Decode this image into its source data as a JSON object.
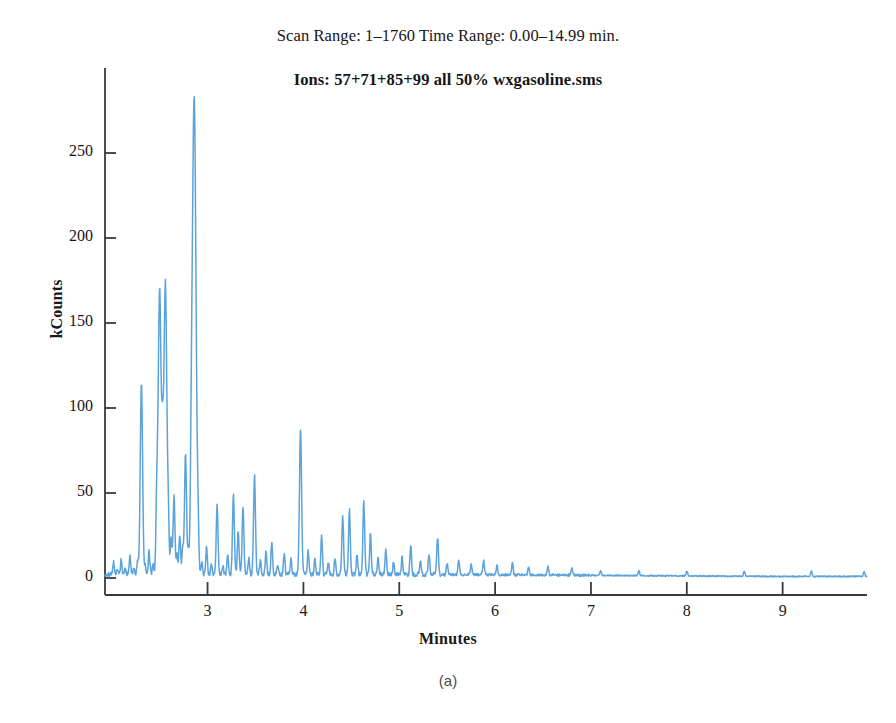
{
  "figure": {
    "panel_caption": "(a)",
    "header_line_1": "Scan Range: 1–1760 Time Range: 0.00–14.99 min.",
    "header_line_2": "Ions: 57+71+85+99 all 50% wxgasoline.sms",
    "trace_color": "#5BA3DC",
    "axis_color": "#3a3a3a"
  },
  "chart_data": {
    "type": "line",
    "title": "Ions: 57+71+85+99 all 50% wxgasoline.sms",
    "subtitle": "Scan Range: 1–1760 Time Range: 0.00–14.99 min.",
    "xlabel": "Minutes",
    "ylabel": "kCounts",
    "xlim": [
      1.93,
      9.88
    ],
    "ylim": [
      -6,
      300
    ],
    "xticks": [
      3,
      4,
      5,
      6,
      7,
      8,
      9
    ],
    "xtick_labels": [
      "3",
      "4",
      "5",
      "6",
      "7",
      "8",
      "9"
    ],
    "yticks": [
      0,
      50,
      100,
      150,
      200,
      250
    ],
    "ytick_labels": [
      "0",
      "50",
      "100",
      "150",
      "200",
      "250"
    ],
    "grid": false,
    "legend": null,
    "series": [
      {
        "name": "Ions 57+71+85+99 extracted ion chromatogram",
        "color": "#5BA3DC",
        "peaks": [
          {
            "x": 2.02,
            "y": 7
          },
          {
            "x": 2.06,
            "y": 3
          },
          {
            "x": 2.1,
            "y": 9
          },
          {
            "x": 2.14,
            "y": 4
          },
          {
            "x": 2.19,
            "y": 11
          },
          {
            "x": 2.23,
            "y": 4
          },
          {
            "x": 2.27,
            "y": 8
          },
          {
            "x": 2.31,
            "y": 113
          },
          {
            "x": 2.35,
            "y": 5
          },
          {
            "x": 2.39,
            "y": 14
          },
          {
            "x": 2.43,
            "y": 6
          },
          {
            "x": 2.47,
            "y": 40
          },
          {
            "x": 2.5,
            "y": 168
          },
          {
            "x": 2.53,
            "y": 60
          },
          {
            "x": 2.56,
            "y": 172
          },
          {
            "x": 2.59,
            "y": 30
          },
          {
            "x": 2.62,
            "y": 22
          },
          {
            "x": 2.65,
            "y": 46
          },
          {
            "x": 2.68,
            "y": 12
          },
          {
            "x": 2.71,
            "y": 24
          },
          {
            "x": 2.74,
            "y": 15
          },
          {
            "x": 2.77,
            "y": 72
          },
          {
            "x": 2.8,
            "y": 12
          },
          {
            "x": 2.83,
            "y": 35
          },
          {
            "x": 2.86,
            "y": 282
          },
          {
            "x": 2.9,
            "y": 18
          },
          {
            "x": 2.94,
            "y": 7
          },
          {
            "x": 2.99,
            "y": 16
          },
          {
            "x": 3.04,
            "y": 6
          },
          {
            "x": 3.1,
            "y": 41
          },
          {
            "x": 3.16,
            "y": 5
          },
          {
            "x": 3.21,
            "y": 12
          },
          {
            "x": 3.27,
            "y": 48
          },
          {
            "x": 3.32,
            "y": 26
          },
          {
            "x": 3.37,
            "y": 40
          },
          {
            "x": 3.43,
            "y": 10
          },
          {
            "x": 3.49,
            "y": 58
          },
          {
            "x": 3.55,
            "y": 8
          },
          {
            "x": 3.61,
            "y": 13
          },
          {
            "x": 3.67,
            "y": 18
          },
          {
            "x": 3.73,
            "y": 6
          },
          {
            "x": 3.8,
            "y": 12
          },
          {
            "x": 3.87,
            "y": 9
          },
          {
            "x": 3.97,
            "y": 85
          },
          {
            "x": 4.05,
            "y": 14
          },
          {
            "x": 4.12,
            "y": 9
          },
          {
            "x": 4.19,
            "y": 22
          },
          {
            "x": 4.26,
            "y": 7
          },
          {
            "x": 4.33,
            "y": 10
          },
          {
            "x": 4.41,
            "y": 35
          },
          {
            "x": 4.48,
            "y": 38
          },
          {
            "x": 4.56,
            "y": 12
          },
          {
            "x": 4.63,
            "y": 42
          },
          {
            "x": 4.7,
            "y": 24
          },
          {
            "x": 4.78,
            "y": 9
          },
          {
            "x": 4.86,
            "y": 14
          },
          {
            "x": 4.94,
            "y": 7
          },
          {
            "x": 5.03,
            "y": 10
          },
          {
            "x": 5.12,
            "y": 17
          },
          {
            "x": 5.22,
            "y": 8
          },
          {
            "x": 5.31,
            "y": 12
          },
          {
            "x": 5.4,
            "y": 22
          },
          {
            "x": 5.5,
            "y": 7
          },
          {
            "x": 5.62,
            "y": 9
          },
          {
            "x": 5.75,
            "y": 6
          },
          {
            "x": 5.88,
            "y": 8
          },
          {
            "x": 6.02,
            "y": 6
          },
          {
            "x": 6.18,
            "y": 7
          },
          {
            "x": 6.35,
            "y": 5
          },
          {
            "x": 6.55,
            "y": 5
          },
          {
            "x": 6.8,
            "y": 4
          },
          {
            "x": 7.1,
            "y": 3
          },
          {
            "x": 7.5,
            "y": 3
          },
          {
            "x": 8.0,
            "y": 3
          },
          {
            "x": 8.6,
            "y": 3
          },
          {
            "x": 9.3,
            "y": 3
          },
          {
            "x": 9.85,
            "y": 3
          }
        ],
        "baseline": 2.0,
        "notes": "Extracted-ion chromatogram of gasoline; dense n-alkane cluster 2.0–5.5 min, largest peak 282 kCounts at 2.86 min, flat baseline after 6.5 min."
      }
    ]
  }
}
